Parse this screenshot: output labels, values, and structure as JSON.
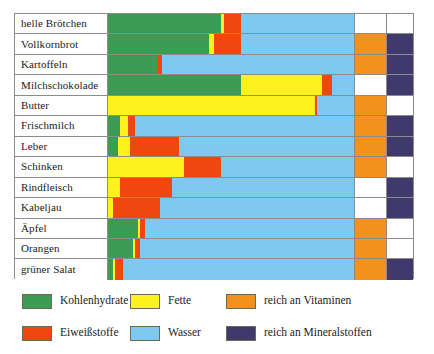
{
  "chart_data": {
    "type": "bar",
    "subtype": "stacked-horizontal-100percent",
    "title": "",
    "xlabel": "",
    "ylabel": "",
    "xlim": [
      0,
      100
    ],
    "grid": false,
    "legend_position": "bottom",
    "categories": [
      "helle Brötchen",
      "Vollkornbrot",
      "Kartoffeln",
      "Milchschokolade",
      "Butter",
      "Frischmilch",
      "Leber",
      "Schinken",
      "Rindfleisch",
      "Kabeljau",
      "Äpfel",
      "Orangen",
      "grüner Salat"
    ],
    "series": [
      {
        "name": "Kohlenhydrate",
        "color": "#3c9c54",
        "values": [
          46,
          41,
          20,
          54,
          0,
          5,
          4,
          0,
          0,
          0,
          12,
          10,
          2
        ]
      },
      {
        "name": "Fette",
        "color": "#fdf21e",
        "values": [
          1,
          2,
          0,
          33,
          84,
          3,
          5,
          31,
          5,
          2,
          1,
          1,
          1
        ]
      },
      {
        "name": "Eiweißstoffe",
        "color": "#f04710",
        "values": [
          7,
          11,
          2,
          4,
          1,
          3,
          20,
          15,
          21,
          19,
          2,
          2,
          3
        ]
      },
      {
        "name": "Wasser",
        "color": "#7ec9ef",
        "values": [
          46,
          46,
          78,
          9,
          15,
          89,
          71,
          54,
          74,
          79,
          85,
          87,
          94
        ]
      }
    ],
    "flags": {
      "vitamin_label": "reich an Vitaminen",
      "vitamin_color": "#f2921d",
      "mineral_label": "reich an Mineralstoffen",
      "mineral_color": "#3f3a6b",
      "rich_in_vitamins": [
        false,
        true,
        true,
        false,
        true,
        true,
        true,
        true,
        false,
        false,
        true,
        true,
        true
      ],
      "rich_in_minerals": [
        false,
        true,
        true,
        true,
        false,
        true,
        true,
        false,
        true,
        true,
        false,
        false,
        true
      ]
    },
    "legend": [
      {
        "label": "Kohlenhydrate",
        "color": "#3c9c54"
      },
      {
        "label": "Fette",
        "color": "#fdf21e"
      },
      {
        "label": "reich an Vitaminen",
        "color": "#f2921d"
      },
      {
        "label": "Eiweißstoffe",
        "color": "#f04710"
      },
      {
        "label": "Wasser",
        "color": "#7ec9ef"
      },
      {
        "label": "reich an Mineralstoffen",
        "color": "#3f3a6b"
      }
    ]
  }
}
